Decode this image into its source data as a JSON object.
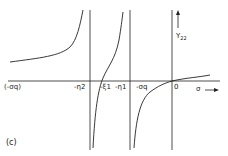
{
  "figure": {
    "panel_label": "(c)",
    "y_axis_label": "Y",
    "y_axis_sub": "22",
    "x_axis_label": "σ",
    "x_ticks": [
      {
        "label": "(-σq)",
        "x": 8
      },
      {
        "label": "-η2",
        "x": 75
      },
      {
        "label": "-ξ1",
        "x": 100
      },
      {
        "label": "-η1",
        "x": 115
      },
      {
        "label": "-σq",
        "x": 135
      },
      {
        "label": "0",
        "x": 173
      }
    ],
    "colors": {
      "line": "#222222",
      "background": "#ffffff"
    }
  }
}
